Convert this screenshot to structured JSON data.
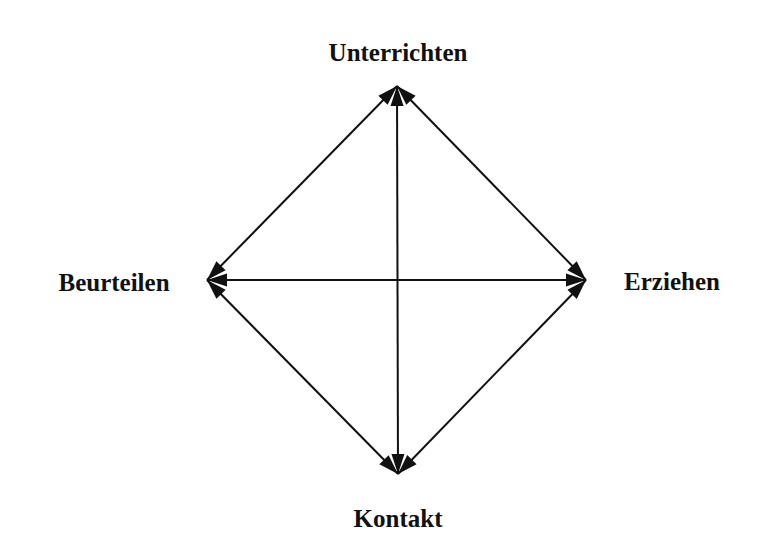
{
  "diagram": {
    "type": "relationship-diamond",
    "colors": {
      "background": "#ffffff",
      "stroke": "#111111",
      "text": "#111111"
    },
    "nodes": [
      {
        "id": "top",
        "label": "Unterrichten",
        "x": 398,
        "y": 52,
        "tip": [
          397,
          86
        ]
      },
      {
        "id": "left",
        "label": "Beurteilen",
        "x": 114,
        "y": 282,
        "tip": [
          207,
          280
        ]
      },
      {
        "id": "right",
        "label": "Erziehen",
        "x": 672,
        "y": 281,
        "tip": [
          586,
          280
        ]
      },
      {
        "id": "bottom",
        "label": "Kontakt",
        "x": 398,
        "y": 518,
        "tip": [
          398,
          474
        ]
      }
    ],
    "edges": [
      {
        "from": "top",
        "to": "left",
        "arrows": "both"
      },
      {
        "from": "top",
        "to": "right",
        "arrows": "both"
      },
      {
        "from": "top",
        "to": "bottom",
        "arrows": "both"
      },
      {
        "from": "left",
        "to": "right",
        "arrows": "both"
      },
      {
        "from": "left",
        "to": "bottom",
        "arrows": "both"
      },
      {
        "from": "right",
        "to": "bottom",
        "arrows": "both"
      }
    ]
  }
}
